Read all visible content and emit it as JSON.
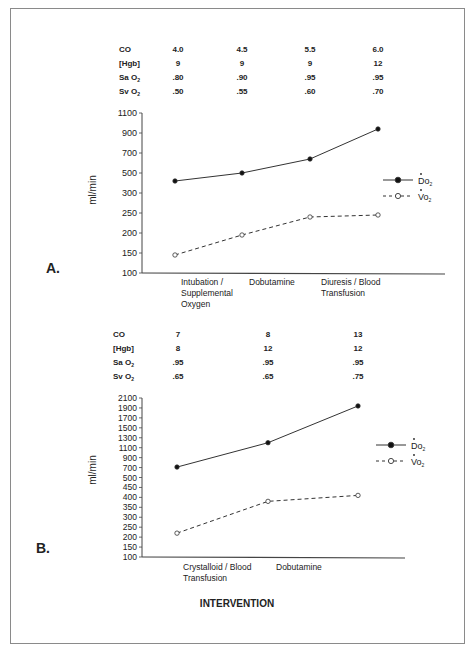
{
  "figure": {
    "x_axis_title": "INTERVENTION",
    "y_axis_label": "ml/min",
    "legend": [
      {
        "label": "Do2",
        "display": "Do",
        "sub": "2",
        "marker": "filled-circle",
        "line": "solid"
      },
      {
        "label": "Vo2",
        "display": "Vo",
        "sub": "2",
        "marker": "open-circle",
        "line": "dashed"
      }
    ]
  },
  "panels": [
    {
      "label": "A.",
      "table": {
        "rows": [
          {
            "name": "CO",
            "sub": "",
            "values": [
              "4.0",
              "4.5",
              "5.5",
              "6.0"
            ]
          },
          {
            "name": "[Hgb]",
            "sub": "",
            "values": [
              "9",
              "9",
              "9",
              "12"
            ]
          },
          {
            "name": "Sa O",
            "sub": "2",
            "values": [
              ".80",
              ".90",
              ".95",
              ".95"
            ]
          },
          {
            "name": "Sv O",
            "sub": "2",
            "values": [
              ".50",
              ".55",
              ".60",
              ".70"
            ]
          }
        ]
      },
      "x_labels": [
        [
          "Intubation /",
          "Supplemental",
          "Oxygen"
        ],
        [
          "Dobutamine"
        ],
        [
          "Diuresis / Blood",
          "Transfusion"
        ]
      ],
      "y_ticks": [
        "1100",
        "900",
        "700",
        "500",
        "300",
        "250",
        "200",
        "150",
        "100"
      ]
    },
    {
      "label": "B.",
      "table": {
        "rows": [
          {
            "name": "CO",
            "sub": "",
            "values": [
              "7",
              "8",
              "13"
            ]
          },
          {
            "name": "[Hgb]",
            "sub": "",
            "values": [
              "8",
              "12",
              "12"
            ]
          },
          {
            "name": "Sa O",
            "sub": "2",
            "values": [
              ".95",
              ".95",
              ".95"
            ]
          },
          {
            "name": "Sv O",
            "sub": "2",
            "values": [
              ".65",
              ".65",
              ".75"
            ]
          }
        ]
      },
      "x_labels": [
        [
          "Crystalloid / Blood",
          "Transfusion"
        ],
        [
          "Dobutamine"
        ]
      ],
      "y_ticks": [
        "2100",
        "1900",
        "1700",
        "1500",
        "1300",
        "1100",
        "900",
        "700",
        "500",
        "450",
        "400",
        "350",
        "300",
        "250",
        "200",
        "150",
        "100"
      ]
    }
  ],
  "chart_data": [
    {
      "type": "line",
      "title": "A.",
      "xlabel": "",
      "ylabel": "ml/min",
      "categories": [
        "Baseline",
        "Intubation / Supplemental Oxygen",
        "Dobutamine",
        "Diuresis / Blood Transfusion"
      ],
      "y_ticks": [
        100,
        150,
        200,
        250,
        300,
        500,
        700,
        900,
        1100
      ],
      "y_scale": "non-linear (segmented)",
      "ylim": [
        100,
        1100
      ],
      "grid": false,
      "legend_position": "right",
      "series": [
        {
          "name": "Do2",
          "style": "solid, filled circles",
          "values": [
            420,
            500,
            640,
            940
          ]
        },
        {
          "name": "Vo2",
          "style": "dashed, open circles",
          "values": [
            145,
            195,
            240,
            245
          ]
        }
      ],
      "table": {
        "CO": [
          4.0,
          4.5,
          5.5,
          6.0
        ],
        "Hgb": [
          9,
          9,
          9,
          12
        ],
        "SaO2": [
          0.8,
          0.9,
          0.95,
          0.95
        ],
        "SvO2": [
          0.5,
          0.55,
          0.6,
          0.7
        ]
      }
    },
    {
      "type": "line",
      "title": "B.",
      "xlabel": "INTERVENTION",
      "ylabel": "ml/min",
      "categories": [
        "Baseline",
        "Crystalloid / Blood Transfusion",
        "Dobutamine"
      ],
      "y_ticks": [
        100,
        150,
        200,
        250,
        300,
        350,
        400,
        450,
        500,
        700,
        900,
        1100,
        1300,
        1500,
        1700,
        1900,
        2100
      ],
      "y_scale": "non-linear (segmented)",
      "ylim": [
        100,
        2100
      ],
      "grid": false,
      "legend_position": "right",
      "series": [
        {
          "name": "Do2",
          "style": "solid, filled circles",
          "values": [
            710,
            1200,
            1940
          ]
        },
        {
          "name": "Vo2",
          "style": "dashed, open circles",
          "values": [
            220,
            380,
            410
          ]
        }
      ],
      "table": {
        "CO": [
          7,
          8,
          13
        ],
        "Hgb": [
          8,
          12,
          12
        ],
        "SaO2": [
          0.95,
          0.95,
          0.95
        ],
        "SvO2": [
          0.65,
          0.65,
          0.75
        ]
      }
    }
  ]
}
